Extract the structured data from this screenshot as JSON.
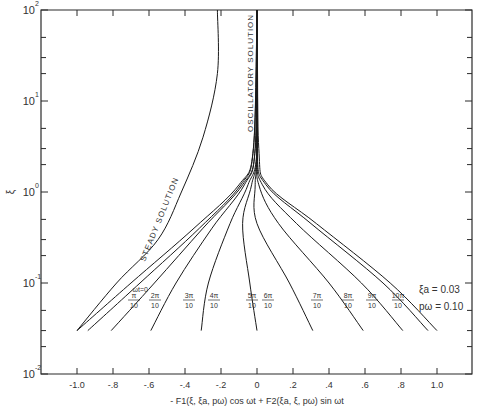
{
  "chart_data": {
    "type": "line",
    "title": "",
    "xlabel": "- F1(ξ, ξa, pω) cos ωt + F2(ξa, ξ, pω) sin ωt",
    "ylabel": "ξ",
    "xlim": [
      -1.2,
      1.2
    ],
    "ylim": [
      0.01,
      100
    ],
    "yscale": "log",
    "grid": false,
    "x_ticks": [
      "-1.0",
      "-.8",
      "-.6",
      "-.4",
      "-.2",
      "0",
      ".2",
      ".4",
      ".6",
      ".8",
      "1.0"
    ],
    "y_ticks": [
      {
        "base": "10",
        "exp": "2"
      },
      {
        "base": "10",
        "exp": "1"
      },
      {
        "base": "10",
        "exp": "0"
      },
      {
        "base": "10",
        "exp": "-1"
      },
      {
        "base": "10",
        "exp": "-2"
      }
    ],
    "annotations": {
      "steady": "STEADY SOLUTION",
      "oscillatory": "OSCILLATORY SOLUTION",
      "xi_a": "ξa = 0.03",
      "p_omega": "pω = 0.10"
    },
    "series": [
      {
        "name": "Steady solution",
        "points": [
          [
            -1.0,
            0.03
          ],
          [
            -0.78,
            0.1
          ],
          [
            -0.55,
            0.3
          ],
          [
            -0.42,
            1.0
          ],
          [
            -0.3,
            4.0
          ],
          [
            -0.22,
            20
          ],
          [
            -0.22,
            100
          ]
        ]
      },
      {
        "name": "ωt=0",
        "label": "ωt=0",
        "points": [
          [
            -1.0,
            0.03
          ],
          [
            -0.7,
            0.1
          ],
          [
            -0.35,
            0.4
          ],
          [
            -0.1,
            1.2
          ],
          [
            -0.02,
            3.0
          ],
          [
            0,
            100
          ]
        ]
      },
      {
        "name": "ωt=π/10",
        "label": "π/10",
        "points": [
          [
            -0.94,
            0.03
          ],
          [
            -0.65,
            0.1
          ],
          [
            -0.32,
            0.4
          ],
          [
            -0.09,
            1.2
          ],
          [
            -0.02,
            3.0
          ],
          [
            0,
            100
          ]
        ]
      },
      {
        "name": "ωt=2π/10",
        "label": "2π/10",
        "points": [
          [
            -0.81,
            0.03
          ],
          [
            -0.57,
            0.1
          ],
          [
            -0.3,
            0.4
          ],
          [
            -0.08,
            1.2
          ],
          [
            -0.01,
            3.0
          ],
          [
            0,
            100
          ]
        ]
      },
      {
        "name": "ωt=3π/10",
        "label": "3π/10",
        "points": [
          [
            -0.59,
            0.03
          ],
          [
            -0.45,
            0.1
          ],
          [
            -0.25,
            0.4
          ],
          [
            -0.07,
            1.2
          ],
          [
            -0.01,
            3.0
          ],
          [
            0,
            100
          ]
        ]
      },
      {
        "name": "ωt=4π/10",
        "label": "4π/10",
        "points": [
          [
            -0.31,
            0.03
          ],
          [
            -0.27,
            0.1
          ],
          [
            -0.15,
            0.45
          ],
          [
            -0.05,
            1.2
          ],
          [
            0,
            3.0
          ],
          [
            0,
            100
          ]
        ]
      },
      {
        "name": "ωt=5π/10",
        "label": "5π/10",
        "points": [
          [
            0.0,
            0.03
          ],
          [
            -0.04,
            0.1
          ],
          [
            -0.08,
            0.45
          ],
          [
            -0.03,
            1.2
          ],
          [
            0,
            3.0
          ],
          [
            0,
            100
          ]
        ]
      },
      {
        "name": "ωt=6π/10",
        "label": "6π/10",
        "points": [
          [
            0.31,
            0.03
          ],
          [
            0.18,
            0.1
          ],
          [
            0.0,
            0.45
          ],
          [
            -0.01,
            1.2
          ],
          [
            0,
            3.0
          ],
          [
            0,
            100
          ]
        ]
      },
      {
        "name": "ωt=7π/10",
        "label": "7π/10",
        "points": [
          [
            0.59,
            0.03
          ],
          [
            0.4,
            0.1
          ],
          [
            0.12,
            0.45
          ],
          [
            0.01,
            1.2
          ],
          [
            0,
            3.0
          ],
          [
            0,
            100
          ]
        ]
      },
      {
        "name": "ωt=8π/10",
        "label": "8π/10",
        "points": [
          [
            0.81,
            0.03
          ],
          [
            0.58,
            0.1
          ],
          [
            0.22,
            0.45
          ],
          [
            0.03,
            1.2
          ],
          [
            0,
            3.0
          ],
          [
            0,
            100
          ]
        ]
      },
      {
        "name": "ωt=9π/10",
        "label": "9π/10",
        "points": [
          [
            0.95,
            0.03
          ],
          [
            0.7,
            0.1
          ],
          [
            0.3,
            0.45
          ],
          [
            0.05,
            1.2
          ],
          [
            0,
            3.0
          ],
          [
            0,
            100
          ]
        ]
      },
      {
        "name": "ωt=10π/10",
        "label": "10π/10",
        "points": [
          [
            1.0,
            0.03
          ],
          [
            0.74,
            0.1
          ],
          [
            0.33,
            0.45
          ],
          [
            0.06,
            1.2
          ],
          [
            0.01,
            3.0
          ],
          [
            0,
            100
          ]
        ]
      }
    ]
  }
}
